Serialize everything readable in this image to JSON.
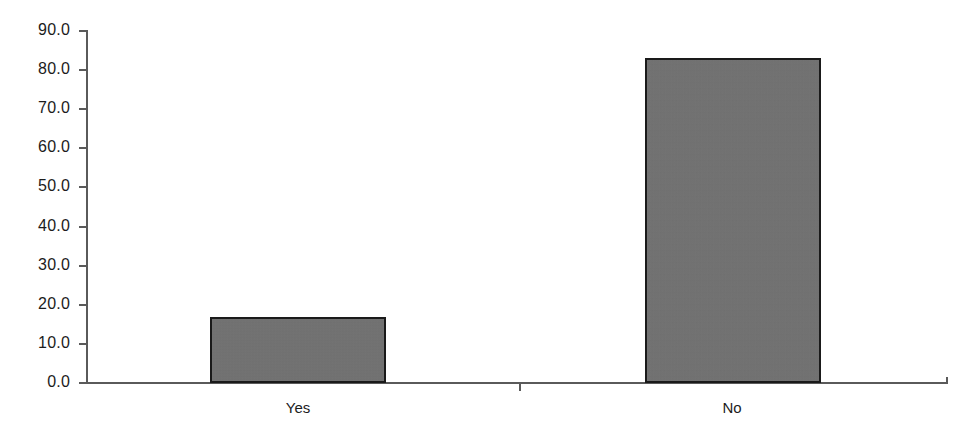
{
  "chart_data": {
    "type": "bar",
    "title": "",
    "subtitle": "",
    "xlabel": "",
    "ylabel": "",
    "categories": [
      "Yes",
      "No"
    ],
    "values": [
      17.0,
      83.0
    ],
    "series": [
      {
        "name": "",
        "values": [
          17.0,
          83.0
        ]
      }
    ],
    "ylim": [
      0.0,
      90.0
    ],
    "ytick_values": [
      0.0,
      10.0,
      20.0,
      30.0,
      40.0,
      50.0,
      60.0,
      70.0,
      80.0,
      90.0
    ],
    "ytick_labels": [
      "0.0",
      "10.0",
      "20.0",
      "30.0",
      "40.0",
      "50.0",
      "60.0",
      "70.0",
      "80.0",
      "90.0"
    ],
    "grid": false,
    "legend": null,
    "legend_position": "none",
    "annotations": [],
    "colors": {
      "bar_fill": "#707070",
      "bar_border": "#1a1a1a",
      "axis": "#5a5a5a",
      "text": "#1c1c1c",
      "background": "#ffffff"
    }
  }
}
